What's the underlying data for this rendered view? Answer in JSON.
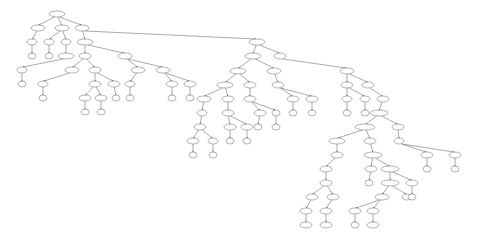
{
  "diagram": {
    "type": "tree",
    "nodes": [
      {
        "id": "n0",
        "x": 57,
        "y": 14,
        "rx": 8,
        "label": ""
      },
      {
        "id": "n1",
        "x": 38,
        "y": 28,
        "rx": 7,
        "label": ""
      },
      {
        "id": "n2",
        "x": 62,
        "y": 28,
        "rx": 7,
        "label": ""
      },
      {
        "id": "n3",
        "x": 82,
        "y": 28,
        "rx": 7,
        "label": ""
      },
      {
        "id": "n4",
        "x": 32,
        "y": 42,
        "rx": 5,
        "label": ""
      },
      {
        "id": "n5",
        "x": 49,
        "y": 42,
        "rx": 5,
        "label": ""
      },
      {
        "id": "n6",
        "x": 66,
        "y": 42,
        "rx": 5,
        "label": ""
      },
      {
        "id": "n7",
        "x": 85,
        "y": 42,
        "rx": 8,
        "label": ""
      },
      {
        "id": "n8",
        "x": 32,
        "y": 56,
        "rx": 4,
        "label": ""
      },
      {
        "id": "n9",
        "x": 49,
        "y": 56,
        "rx": 4,
        "label": ""
      },
      {
        "id": "n10",
        "x": 66,
        "y": 56,
        "rx": 8,
        "label": ""
      },
      {
        "id": "n11",
        "x": 85,
        "y": 56,
        "rx": 6,
        "label": ""
      },
      {
        "id": "n12",
        "x": 125,
        "y": 56,
        "rx": 7,
        "label": ""
      },
      {
        "id": "n13",
        "x": 22,
        "y": 70,
        "rx": 5,
        "label": ""
      },
      {
        "id": "n14",
        "x": 72,
        "y": 70,
        "rx": 7,
        "label": ""
      },
      {
        "id": "n15",
        "x": 95,
        "y": 70,
        "rx": 6,
        "label": ""
      },
      {
        "id": "n16",
        "x": 138,
        "y": 70,
        "rx": 7,
        "label": ""
      },
      {
        "id": "n17",
        "x": 163,
        "y": 70,
        "rx": 7,
        "label": ""
      },
      {
        "id": "n18",
        "x": 22,
        "y": 84,
        "rx": 4,
        "label": ""
      },
      {
        "id": "n19",
        "x": 43,
        "y": 84,
        "rx": 5,
        "label": ""
      },
      {
        "id": "n20",
        "x": 95,
        "y": 84,
        "rx": 6,
        "label": ""
      },
      {
        "id": "n21",
        "x": 114,
        "y": 84,
        "rx": 6,
        "label": ""
      },
      {
        "id": "n22",
        "x": 130,
        "y": 84,
        "rx": 5,
        "label": ""
      },
      {
        "id": "n23",
        "x": 172,
        "y": 84,
        "rx": 6,
        "label": ""
      },
      {
        "id": "n24",
        "x": 190,
        "y": 84,
        "rx": 6,
        "label": ""
      },
      {
        "id": "n25",
        "x": 43,
        "y": 98,
        "rx": 4,
        "label": ""
      },
      {
        "id": "n26",
        "x": 85,
        "y": 98,
        "rx": 6,
        "label": ""
      },
      {
        "id": "n27",
        "x": 101,
        "y": 98,
        "rx": 6,
        "label": ""
      },
      {
        "id": "n28",
        "x": 116,
        "y": 98,
        "rx": 4,
        "label": ""
      },
      {
        "id": "n29",
        "x": 130,
        "y": 98,
        "rx": 4,
        "label": ""
      },
      {
        "id": "n30",
        "x": 172,
        "y": 98,
        "rx": 4,
        "label": ""
      },
      {
        "id": "n31",
        "x": 190,
        "y": 98,
        "rx": 4,
        "label": ""
      },
      {
        "id": "n32",
        "x": 85,
        "y": 112,
        "rx": 4,
        "label": ""
      },
      {
        "id": "n33",
        "x": 101,
        "y": 112,
        "rx": 4,
        "label": ""
      },
      {
        "id": "n34",
        "x": 257,
        "y": 42,
        "rx": 8,
        "label": ""
      },
      {
        "id": "n35",
        "x": 253,
        "y": 56,
        "rx": 8,
        "label": ""
      },
      {
        "id": "n36",
        "x": 280,
        "y": 56,
        "rx": 6,
        "label": ""
      },
      {
        "id": "n37",
        "x": 238,
        "y": 71,
        "rx": 8,
        "label": ""
      },
      {
        "id": "n38",
        "x": 274,
        "y": 71,
        "rx": 7,
        "label": ""
      },
      {
        "id": "n39",
        "x": 225,
        "y": 85,
        "rx": 8,
        "label": ""
      },
      {
        "id": "n40",
        "x": 250,
        "y": 85,
        "rx": 6,
        "label": ""
      },
      {
        "id": "n41",
        "x": 278,
        "y": 85,
        "rx": 6,
        "label": ""
      },
      {
        "id": "n42",
        "x": 204,
        "y": 99,
        "rx": 7,
        "label": ""
      },
      {
        "id": "n43",
        "x": 228,
        "y": 99,
        "rx": 6,
        "label": ""
      },
      {
        "id": "n44",
        "x": 250,
        "y": 99,
        "rx": 6,
        "label": ""
      },
      {
        "id": "n45",
        "x": 293,
        "y": 99,
        "rx": 6,
        "label": ""
      },
      {
        "id": "n46",
        "x": 312,
        "y": 99,
        "rx": 6,
        "label": ""
      },
      {
        "id": "n47",
        "x": 202,
        "y": 113,
        "rx": 5,
        "label": ""
      },
      {
        "id": "n48",
        "x": 228,
        "y": 113,
        "rx": 6,
        "label": ""
      },
      {
        "id": "n49",
        "x": 260,
        "y": 113,
        "rx": 6,
        "label": ""
      },
      {
        "id": "n50",
        "x": 276,
        "y": 113,
        "rx": 4,
        "label": ""
      },
      {
        "id": "n51",
        "x": 293,
        "y": 113,
        "rx": 4,
        "label": ""
      },
      {
        "id": "n52",
        "x": 312,
        "y": 113,
        "rx": 4,
        "label": ""
      },
      {
        "id": "n53",
        "x": 200,
        "y": 127,
        "rx": 6,
        "label": ""
      },
      {
        "id": "n54",
        "x": 230,
        "y": 127,
        "rx": 6,
        "label": ""
      },
      {
        "id": "n55",
        "x": 247,
        "y": 127,
        "rx": 6,
        "label": ""
      },
      {
        "id": "n56",
        "x": 258,
        "y": 127,
        "rx": 4,
        "label": ""
      },
      {
        "id": "n57",
        "x": 276,
        "y": 127,
        "rx": 4,
        "label": ""
      },
      {
        "id": "n58",
        "x": 193,
        "y": 141,
        "rx": 6,
        "label": ""
      },
      {
        "id": "n59",
        "x": 213,
        "y": 141,
        "rx": 5,
        "label": ""
      },
      {
        "id": "n60",
        "x": 230,
        "y": 141,
        "rx": 4,
        "label": ""
      },
      {
        "id": "n61",
        "x": 247,
        "y": 141,
        "rx": 4,
        "label": ""
      },
      {
        "id": "n62",
        "x": 193,
        "y": 155,
        "rx": 4,
        "label": ""
      },
      {
        "id": "n63",
        "x": 213,
        "y": 155,
        "rx": 4,
        "label": ""
      },
      {
        "id": "n64",
        "x": 347,
        "y": 71,
        "rx": 7,
        "label": ""
      },
      {
        "id": "n65",
        "x": 347,
        "y": 85,
        "rx": 6,
        "label": ""
      },
      {
        "id": "n66",
        "x": 368,
        "y": 85,
        "rx": 6,
        "label": ""
      },
      {
        "id": "n67",
        "x": 347,
        "y": 99,
        "rx": 5,
        "label": ""
      },
      {
        "id": "n68",
        "x": 365,
        "y": 99,
        "rx": 5,
        "label": ""
      },
      {
        "id": "n69",
        "x": 383,
        "y": 99,
        "rx": 6,
        "label": ""
      },
      {
        "id": "n70",
        "x": 347,
        "y": 113,
        "rx": 4,
        "label": ""
      },
      {
        "id": "n71",
        "x": 365,
        "y": 113,
        "rx": 4,
        "label": ""
      },
      {
        "id": "n72",
        "x": 379,
        "y": 113,
        "rx": 9,
        "label": ""
      },
      {
        "id": "n73",
        "x": 365,
        "y": 127,
        "rx": 10,
        "label": ""
      },
      {
        "id": "n74",
        "x": 398,
        "y": 127,
        "rx": 6,
        "label": ""
      },
      {
        "id": "n75",
        "x": 337,
        "y": 141,
        "rx": 8,
        "label": ""
      },
      {
        "id": "n76",
        "x": 370,
        "y": 141,
        "rx": 6,
        "label": ""
      },
      {
        "id": "n77",
        "x": 399,
        "y": 141,
        "rx": 5,
        "label": ""
      },
      {
        "id": "n78",
        "x": 337,
        "y": 155,
        "rx": 6,
        "label": ""
      },
      {
        "id": "n79",
        "x": 373,
        "y": 155,
        "rx": 9,
        "label": ""
      },
      {
        "id": "n80",
        "x": 427,
        "y": 155,
        "rx": 6,
        "label": ""
      },
      {
        "id": "n81",
        "x": 455,
        "y": 155,
        "rx": 6,
        "label": ""
      },
      {
        "id": "n82",
        "x": 326,
        "y": 169,
        "rx": 6,
        "label": ""
      },
      {
        "id": "n83",
        "x": 371,
        "y": 169,
        "rx": 6,
        "label": ""
      },
      {
        "id": "n84",
        "x": 390,
        "y": 169,
        "rx": 9,
        "label": ""
      },
      {
        "id": "n85",
        "x": 427,
        "y": 169,
        "rx": 4,
        "label": ""
      },
      {
        "id": "n86",
        "x": 455,
        "y": 169,
        "rx": 4,
        "label": ""
      },
      {
        "id": "n87",
        "x": 326,
        "y": 183,
        "rx": 6,
        "label": ""
      },
      {
        "id": "n88",
        "x": 369,
        "y": 183,
        "rx": 4,
        "label": ""
      },
      {
        "id": "n89",
        "x": 390,
        "y": 183,
        "rx": 9,
        "label": ""
      },
      {
        "id": "n90",
        "x": 412,
        "y": 183,
        "rx": 6,
        "label": ""
      },
      {
        "id": "n91",
        "x": 312,
        "y": 197,
        "rx": 6,
        "label": ""
      },
      {
        "id": "n92",
        "x": 333,
        "y": 197,
        "rx": 6,
        "label": ""
      },
      {
        "id": "n93",
        "x": 382,
        "y": 197,
        "rx": 7,
        "label": ""
      },
      {
        "id": "n94",
        "x": 407,
        "y": 197,
        "rx": 5,
        "label": ""
      },
      {
        "id": "n95",
        "x": 412,
        "y": 197,
        "rx": 4,
        "label": ""
      },
      {
        "id": "n96",
        "x": 306,
        "y": 211,
        "rx": 6,
        "label": ""
      },
      {
        "id": "n97",
        "x": 326,
        "y": 211,
        "rx": 6,
        "label": ""
      },
      {
        "id": "n98",
        "x": 355,
        "y": 211,
        "rx": 6,
        "label": ""
      },
      {
        "id": "n99",
        "x": 373,
        "y": 211,
        "rx": 6,
        "label": ""
      },
      {
        "id": "n100",
        "x": 306,
        "y": 225,
        "rx": 6,
        "label": ""
      },
      {
        "id": "n101",
        "x": 326,
        "y": 225,
        "rx": 6,
        "label": ""
      },
      {
        "id": "n102",
        "x": 355,
        "y": 225,
        "rx": 4,
        "label": ""
      },
      {
        "id": "n103",
        "x": 373,
        "y": 225,
        "rx": 6,
        "label": ""
      }
    ],
    "edges": [
      [
        "n0",
        "n1"
      ],
      [
        "n0",
        "n2"
      ],
      [
        "n0",
        "n3"
      ],
      [
        "n1",
        "n4"
      ],
      [
        "n2",
        "n5"
      ],
      [
        "n2",
        "n6"
      ],
      [
        "n3",
        "n7"
      ],
      [
        "n3",
        "n34"
      ],
      [
        "n4",
        "n8"
      ],
      [
        "n5",
        "n9"
      ],
      [
        "n6",
        "n10"
      ],
      [
        "n7",
        "n11"
      ],
      [
        "n7",
        "n12"
      ],
      [
        "n10",
        "n13"
      ],
      [
        "n11",
        "n14"
      ],
      [
        "n11",
        "n15"
      ],
      [
        "n12",
        "n16"
      ],
      [
        "n12",
        "n17"
      ],
      [
        "n13",
        "n18"
      ],
      [
        "n14",
        "n19"
      ],
      [
        "n15",
        "n20"
      ],
      [
        "n15",
        "n21"
      ],
      [
        "n16",
        "n22"
      ],
      [
        "n17",
        "n23"
      ],
      [
        "n17",
        "n24"
      ],
      [
        "n19",
        "n25"
      ],
      [
        "n20",
        "n26"
      ],
      [
        "n20",
        "n27"
      ],
      [
        "n21",
        "n28"
      ],
      [
        "n22",
        "n29"
      ],
      [
        "n23",
        "n30"
      ],
      [
        "n24",
        "n31"
      ],
      [
        "n26",
        "n32"
      ],
      [
        "n27",
        "n33"
      ],
      [
        "n34",
        "n35"
      ],
      [
        "n34",
        "n36"
      ],
      [
        "n35",
        "n37"
      ],
      [
        "n35",
        "n38"
      ],
      [
        "n36",
        "n64"
      ],
      [
        "n37",
        "n39"
      ],
      [
        "n37",
        "n40"
      ],
      [
        "n38",
        "n41"
      ],
      [
        "n39",
        "n42"
      ],
      [
        "n39",
        "n43"
      ],
      [
        "n40",
        "n44"
      ],
      [
        "n41",
        "n45"
      ],
      [
        "n41",
        "n46"
      ],
      [
        "n42",
        "n47"
      ],
      [
        "n43",
        "n48"
      ],
      [
        "n44",
        "n49"
      ],
      [
        "n44",
        "n50"
      ],
      [
        "n45",
        "n51"
      ],
      [
        "n46",
        "n52"
      ],
      [
        "n47",
        "n53"
      ],
      [
        "n48",
        "n54"
      ],
      [
        "n48",
        "n55"
      ],
      [
        "n49",
        "n56"
      ],
      [
        "n50",
        "n57"
      ],
      [
        "n53",
        "n58"
      ],
      [
        "n53",
        "n59"
      ],
      [
        "n54",
        "n60"
      ],
      [
        "n55",
        "n61"
      ],
      [
        "n58",
        "n62"
      ],
      [
        "n59",
        "n63"
      ],
      [
        "n64",
        "n65"
      ],
      [
        "n64",
        "n66"
      ],
      [
        "n65",
        "n67"
      ],
      [
        "n65",
        "n68"
      ],
      [
        "n66",
        "n69"
      ],
      [
        "n67",
        "n70"
      ],
      [
        "n68",
        "n71"
      ],
      [
        "n69",
        "n72"
      ],
      [
        "n72",
        "n73"
      ],
      [
        "n72",
        "n74"
      ],
      [
        "n73",
        "n75"
      ],
      [
        "n73",
        "n76"
      ],
      [
        "n74",
        "n77"
      ],
      [
        "n75",
        "n78"
      ],
      [
        "n76",
        "n79"
      ],
      [
        "n77",
        "n80"
      ],
      [
        "n77",
        "n81"
      ],
      [
        "n78",
        "n82"
      ],
      [
        "n79",
        "n83"
      ],
      [
        "n79",
        "n84"
      ],
      [
        "n80",
        "n85"
      ],
      [
        "n81",
        "n86"
      ],
      [
        "n82",
        "n87"
      ],
      [
        "n83",
        "n88"
      ],
      [
        "n84",
        "n89"
      ],
      [
        "n84",
        "n90"
      ],
      [
        "n87",
        "n91"
      ],
      [
        "n87",
        "n92"
      ],
      [
        "n89",
        "n93"
      ],
      [
        "n89",
        "n94"
      ],
      [
        "n90",
        "n95"
      ],
      [
        "n91",
        "n96"
      ],
      [
        "n92",
        "n97"
      ],
      [
        "n93",
        "n98"
      ],
      [
        "n93",
        "n99"
      ],
      [
        "n96",
        "n100"
      ],
      [
        "n97",
        "n101"
      ],
      [
        "n98",
        "n102"
      ],
      [
        "n99",
        "n103"
      ]
    ]
  }
}
